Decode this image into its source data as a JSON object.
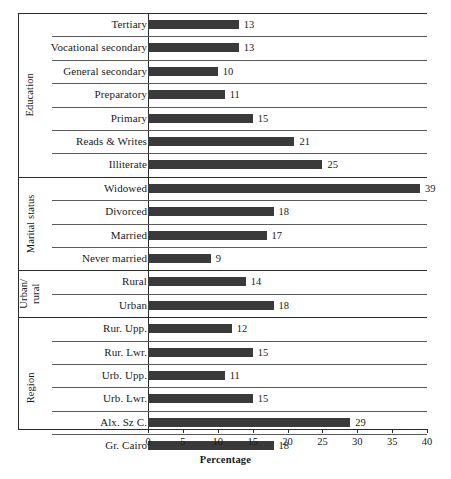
{
  "chart_data": {
    "type": "bar",
    "orientation": "horizontal",
    "title": "",
    "xlabel": "Percentage",
    "ylabel": "",
    "xlim": [
      0,
      40
    ],
    "xticks": [
      0,
      5,
      10,
      15,
      20,
      25,
      30,
      35,
      40
    ],
    "grid": false,
    "legend": false,
    "bar_color": "#3a3a3a",
    "categories": [
      "Tertiary",
      "Vocational secondary",
      "General secondary",
      "Preparatory",
      "Primary",
      "Reads & Writes",
      "Illiterate",
      "Widowed",
      "Divorced",
      "Married",
      "Never married",
      "Rural",
      "Urban",
      "Rur. Upp.",
      "Rur. Lwr.",
      "Urb. Upp.",
      "Urb. Lwr.",
      "Alx. Sz C.",
      "Gr. Cairo"
    ],
    "values": [
      13,
      13,
      10,
      11,
      15,
      21,
      25,
      39,
      18,
      17,
      9,
      14,
      18,
      12,
      15,
      11,
      15,
      29,
      18
    ],
    "groups": [
      {
        "label": "Education",
        "items": [
          {
            "label": "Tertiary",
            "value": 13
          },
          {
            "label": "Vocational secondary",
            "value": 13
          },
          {
            "label": "General secondary",
            "value": 10
          },
          {
            "label": "Preparatory",
            "value": 11
          },
          {
            "label": "Primary",
            "value": 15
          },
          {
            "label": "Reads & Writes",
            "value": 21
          },
          {
            "label": "Illiterate",
            "value": 25
          }
        ]
      },
      {
        "label": "Marital status",
        "items": [
          {
            "label": "Widowed",
            "value": 39
          },
          {
            "label": "Divorced",
            "value": 18
          },
          {
            "label": "Married",
            "value": 17
          },
          {
            "label": "Never married",
            "value": 9
          }
        ]
      },
      {
        "label": "Urban/ rural",
        "items": [
          {
            "label": "Rural",
            "value": 14
          },
          {
            "label": "Urban",
            "value": 18
          }
        ]
      },
      {
        "label": "Region",
        "items": [
          {
            "label": "Rur. Upp.",
            "value": 12
          },
          {
            "label": "Rur. Lwr.",
            "value": 15
          },
          {
            "label": "Urb. Upp.",
            "value": 11
          },
          {
            "label": "Urb. Lwr.",
            "value": 15
          },
          {
            "label": "Alx. Sz C.",
            "value": 29
          },
          {
            "label": "Gr. Cairo",
            "value": 18
          }
        ]
      }
    ]
  }
}
